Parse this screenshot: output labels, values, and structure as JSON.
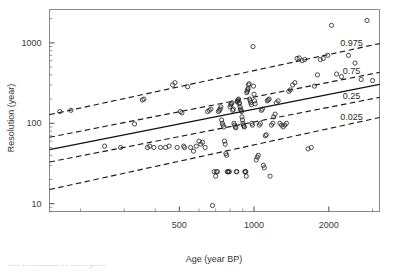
{
  "figure": {
    "background": "#ffffff",
    "marker_color": "#2b2b2b",
    "line_color": "#1a1a1a"
  },
  "axes": {
    "x_title": "Age (year BP)",
    "y_title": "Resolution (year)",
    "x_ticklabels": [
      "500",
      "1000",
      "2000"
    ],
    "y_ticklabels": [
      "10",
      "100",
      "1000"
    ]
  },
  "caption": {
    "clipped_text": "The resolution of most prox"
  },
  "chart_data": {
    "type": "scatter",
    "title": "",
    "xlabel": "Age (year BP)",
    "ylabel": "Resolution (year)",
    "xscale": "log",
    "yscale": "log",
    "xlim": [
      150,
      3200
    ],
    "ylim": [
      8,
      2600
    ],
    "grid": false,
    "legend": "none",
    "xticks": [
      500,
      1000,
      2000
    ],
    "yticks": [
      10,
      100,
      1000
    ],
    "marker": "open-circle",
    "x": [
      165,
      183,
      250,
      290,
      330,
      355,
      360,
      372,
      380,
      395,
      420,
      440,
      455,
      470,
      480,
      490,
      505,
      512,
      520,
      525,
      540,
      555,
      570,
      585,
      600,
      610,
      620,
      635,
      650,
      660,
      670,
      680,
      690,
      700,
      705,
      712,
      718,
      724,
      730,
      735,
      740,
      745,
      750,
      755,
      760,
      765,
      770,
      775,
      780,
      785,
      790,
      795,
      800,
      805,
      810,
      815,
      820,
      825,
      830,
      835,
      840,
      845,
      848,
      852,
      855,
      858,
      862,
      866,
      870,
      874,
      878,
      882,
      886,
      890,
      894,
      898,
      902,
      906,
      910,
      914,
      918,
      922,
      926,
      930,
      934,
      938,
      942,
      946,
      950,
      955,
      960,
      965,
      970,
      975,
      980,
      985,
      990,
      995,
      1000,
      1005,
      1010,
      1020,
      1030,
      1040,
      1050,
      1060,
      1070,
      1080,
      1090,
      1100,
      1110,
      1120,
      1130,
      1140,
      1150,
      1160,
      1175,
      1190,
      1200,
      1215,
      1230,
      1250,
      1270,
      1290,
      1310,
      1330,
      1350,
      1380,
      1400,
      1430,
      1460,
      1490,
      1520,
      1560,
      1600,
      1650,
      1700,
      1750,
      1800,
      1850,
      1900,
      1980,
      2050,
      2150,
      2250,
      2400,
      2550,
      2700,
      2850,
      3000
    ],
    "y": [
      140,
      145,
      52,
      50,
      98,
      195,
      200,
      50,
      52,
      50,
      50,
      50,
      52,
      300,
      320,
      50,
      140,
      135,
      52,
      50,
      285,
      50,
      45,
      52,
      60,
      55,
      58,
      50,
      140,
      145,
      150,
      9.5,
      25,
      22,
      25,
      25,
      140,
      145,
      150,
      160,
      110,
      100,
      95,
      90,
      60,
      55,
      42,
      40,
      25,
      25,
      25,
      25,
      160,
      170,
      175,
      180,
      145,
      150,
      100,
      95,
      90,
      88,
      25,
      25,
      185,
      190,
      195,
      200,
      175,
      180,
      160,
      150,
      145,
      140,
      120,
      110,
      100,
      95,
      92,
      90,
      25,
      25,
      25,
      22,
      240,
      250,
      260,
      270,
      300,
      310,
      200,
      190,
      180,
      170,
      100,
      95,
      900,
      290,
      230,
      190,
      175,
      35,
      38,
      40,
      95,
      100,
      145,
      150,
      30,
      28,
      70,
      72,
      190,
      195,
      200,
      22,
      95,
      100,
      120,
      130,
      180,
      190,
      100,
      95,
      90,
      95,
      100,
      250,
      260,
      300,
      320,
      640,
      650,
      600,
      620,
      48,
      50,
      290,
      400,
      620,
      640,
      700,
      1650,
      410,
      380,
      700,
      560,
      350,
      1900,
      340,
      1800,
      1600
    ],
    "quantile_lines": [
      {
        "label": "0.975",
        "quantile": 0.975,
        "style": "dashed",
        "x": [
          150,
          3200
        ],
        "y": [
          128,
          980
        ]
      },
      {
        "label": "0.75",
        "quantile": 0.75,
        "style": "dashed",
        "x": [
          150,
          3200
        ],
        "y": [
          67,
          430
        ]
      },
      {
        "label": "0.5",
        "quantile": 0.5,
        "style": "solid",
        "x": [
          150,
          3200
        ],
        "y": [
          47,
          305
        ]
      },
      {
        "label": "0.25",
        "quantile": 0.25,
        "style": "dashed",
        "x": [
          150,
          3200
        ],
        "y": [
          33,
          210
        ]
      },
      {
        "label": "0.025",
        "quantile": 0.025,
        "style": "dashed",
        "x": [
          150,
          3200
        ],
        "y": [
          15,
          118
        ]
      }
    ]
  }
}
